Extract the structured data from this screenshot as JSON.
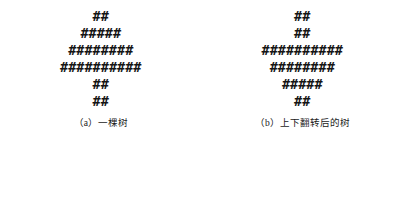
{
  "page": {
    "background_color": "#ffffff",
    "ink_color": "#151515",
    "glyph": "#"
  },
  "figures": [
    {
      "id": "tree-upright",
      "label": "(a)",
      "caption": "一棵树",
      "caption_full": "（a）一棵树",
      "row_counts": [
        2,
        5,
        8,
        10,
        2,
        2
      ],
      "rows": [
        "##",
        "#####",
        "########",
        "##########",
        "##",
        "##"
      ]
    },
    {
      "id": "tree-flipped",
      "label": "(b)",
      "caption": "上下翻转后的树",
      "caption_full": "（b）上下翻转后的树",
      "row_counts": [
        2,
        2,
        10,
        8,
        5,
        2
      ],
      "rows": [
        "##",
        "##",
        "##########",
        "########",
        "#####",
        "##"
      ]
    }
  ]
}
